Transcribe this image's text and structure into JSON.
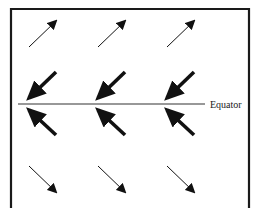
{
  "diagram": {
    "title": "",
    "equator_label": "Equator",
    "colors": {
      "frame": "#1a1a1a",
      "arrow": "#111111",
      "line": "#333333"
    },
    "rows": [
      {
        "name": "upper-outer",
        "hemisphere": "north",
        "direction": "northeast",
        "weight": "thin"
      },
      {
        "name": "upper-inner",
        "hemisphere": "north",
        "direction": "southwest",
        "weight": "thick"
      },
      {
        "name": "lower-inner",
        "hemisphere": "south",
        "direction": "northwest",
        "weight": "thick"
      },
      {
        "name": "lower-outer",
        "hemisphere": "south",
        "direction": "southeast",
        "weight": "thin"
      }
    ],
    "arrows_per_row": 3
  }
}
